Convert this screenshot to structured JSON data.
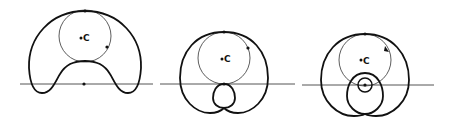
{
  "diagram": {
    "figures": [
      {
        "id": "figure-1",
        "center_label": "C",
        "generating_circle": {
          "cx": 85,
          "cy": 36,
          "r": 26
        },
        "axis_line": {
          "x1": 20,
          "x2": 153,
          "y": 84
        },
        "marked_points": [
          {
            "x": 85,
            "y": 11
          },
          {
            "x": 107,
            "y": 47
          },
          {
            "x": 84,
            "y": 84
          }
        ],
        "curve_type": "limacon-with-dimple"
      },
      {
        "id": "figure-2",
        "center_label": "C",
        "generating_circle": {
          "cx": 224,
          "cy": 58,
          "r": 26
        },
        "axis_line": {
          "x1": 160,
          "x2": 295,
          "y": 84
        },
        "marked_points": [
          {
            "x": 224,
            "y": 32
          },
          {
            "x": 248,
            "y": 48
          },
          {
            "x": 224,
            "y": 84
          }
        ],
        "curve_type": "limacon-with-inner-loop"
      },
      {
        "id": "figure-3",
        "center_label": "C",
        "generating_circle": {
          "cx": 365,
          "cy": 60,
          "r": 26
        },
        "small_circle": {
          "cx": 365,
          "cy": 85,
          "r": 7
        },
        "axis_line": {
          "x1": 302,
          "x2": 434,
          "y": 85
        },
        "marked_points": [
          {
            "x": 365,
            "y": 34
          },
          {
            "x": 365,
            "y": 85
          }
        ],
        "arrow_point": {
          "x": 387,
          "y": 50
        },
        "curve_type": "limacon-with-large-inner-loop"
      }
    ],
    "colors": {
      "curve": "#111111",
      "thin_circle": "#333333",
      "axis": "#555555"
    }
  }
}
